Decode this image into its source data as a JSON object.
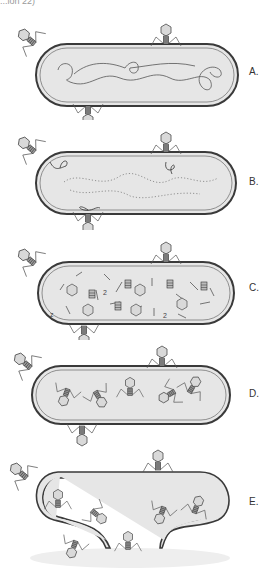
{
  "figure": {
    "cut_header_text": "...ion 22)",
    "panels": [
      {
        "label": "A.",
        "stage": "phage adsorption; intact bacterial chromosome",
        "top": 0
      },
      {
        "label": "B.",
        "stage": "phage DNA injected; host chromosome degraded",
        "top": 110
      },
      {
        "label": "C.",
        "stage": "phage components (heads, tails, fibers, DNA) synthesized",
        "top": 220
      },
      {
        "label": "D.",
        "stage": "assembly of mature phage particles",
        "top": 330
      },
      {
        "label": "E.",
        "stage": "cell lysis and release of progeny phage",
        "top": 440
      }
    ],
    "colors": {
      "background": "#ffffff",
      "cell_fill": "#e6e6e6",
      "cell_wall": "#3a3a3a",
      "phage_head": "#d9d9d9",
      "line": "#4a4a4a",
      "label": "#333333"
    }
  }
}
